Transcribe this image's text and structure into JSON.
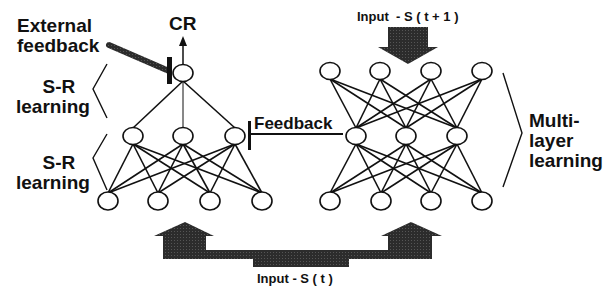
{
  "diagram": {
    "labels": {
      "external_feedback": [
        "External",
        "feedback"
      ],
      "cr": "CR",
      "sr_learning_top": [
        "S-R",
        "learning"
      ],
      "sr_learning_bottom": [
        "S-R",
        "learning"
      ],
      "feedback": "Feedback",
      "multilayer_learning": [
        "Multi-",
        "layer",
        "learning"
      ],
      "input_next": "Input  - S ( t + 1 )",
      "input_current": "Input - S ( t )"
    },
    "colors": {
      "stroke": "#111111",
      "arrow_fill": "#2a2a2a",
      "background": "#ffffff"
    },
    "left_network": {
      "output_node": {
        "x": 183,
        "y": 73
      },
      "hidden_nodes": [
        {
          "x": 133,
          "y": 136
        },
        {
          "x": 183,
          "y": 136
        },
        {
          "x": 235,
          "y": 136
        }
      ],
      "input_nodes": [
        {
          "x": 108,
          "y": 201
        },
        {
          "x": 158,
          "y": 201
        },
        {
          "x": 210,
          "y": 201
        },
        {
          "x": 262,
          "y": 201
        }
      ]
    },
    "right_network": {
      "top_nodes": [
        {
          "x": 330,
          "y": 71
        },
        {
          "x": 380,
          "y": 71
        },
        {
          "x": 431,
          "y": 71
        },
        {
          "x": 482,
          "y": 71
        }
      ],
      "hidden_nodes": [
        {
          "x": 356,
          "y": 136
        },
        {
          "x": 406,
          "y": 136
        },
        {
          "x": 457,
          "y": 136
        }
      ],
      "bottom_nodes": [
        {
          "x": 330,
          "y": 201
        },
        {
          "x": 381,
          "y": 201
        },
        {
          "x": 431,
          "y": 201
        },
        {
          "x": 482,
          "y": 201
        }
      ]
    }
  }
}
